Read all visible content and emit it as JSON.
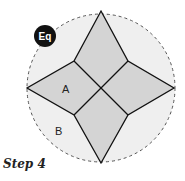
{
  "diagram": {
    "badge": {
      "label": "Eq",
      "color": "#111111"
    },
    "labels": {
      "a": "A",
      "b": "B"
    },
    "caption": "Step 4",
    "colors": {
      "circle_fill": "#efefef",
      "circle_stroke": "#555555",
      "star_fill": "#d4d4d4",
      "line": "#111111"
    }
  }
}
